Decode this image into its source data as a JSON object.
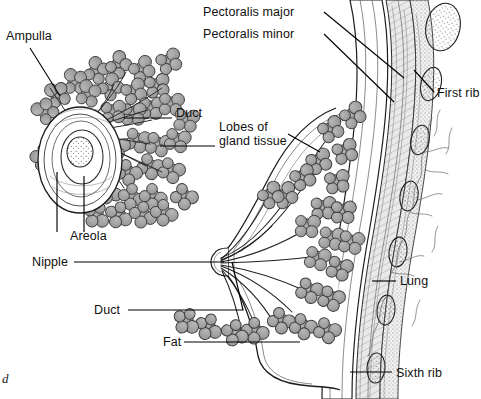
{
  "figure": {
    "part_marker": "d",
    "canvas": {
      "width": 481,
      "height": 399
    },
    "colors": {
      "background": "#ffffff",
      "ink": "#101010",
      "lobule_fill": "#9e9e9e",
      "lobule_stroke": "#3a3a3a",
      "duct_stroke": "#1a1a1a",
      "leader_line": "#000000",
      "muscle_fill": "#d6d6d6",
      "rib_fill": "#f2f2f2",
      "lung_stroke": "#555555"
    }
  },
  "labels": [
    {
      "id": "ampulla",
      "text": "Ampulla",
      "x": 6,
      "y": 36,
      "lines": [
        "Ampulla"
      ]
    },
    {
      "id": "duct-inset",
      "text": "Duct",
      "x": 176,
      "y": 113,
      "lines": [
        "Duct"
      ]
    },
    {
      "id": "lobes-of-gland",
      "text": "Lobes of gland tissue",
      "x": 219,
      "y": 127,
      "lines": [
        "Lobes of",
        "gland tissue"
      ]
    },
    {
      "id": "areola",
      "text": "Areola",
      "x": 70,
      "y": 236,
      "lines": [
        "Areola"
      ]
    },
    {
      "id": "nipple",
      "text": "Nipple",
      "x": 32,
      "y": 256,
      "lines": [
        "Nipple"
      ]
    },
    {
      "id": "duct-main",
      "text": "Duct",
      "x": 94,
      "y": 306,
      "lines": [
        "Duct"
      ]
    },
    {
      "id": "fat",
      "text": "Fat",
      "x": 163,
      "y": 337,
      "lines": [
        "Fat"
      ]
    },
    {
      "id": "pectoralis-major",
      "text": "Pectoralis major",
      "x": 203,
      "y": 7,
      "lines": [
        "Pectoralis major"
      ]
    },
    {
      "id": "pectoralis-minor",
      "text": "Pectoralis minor",
      "x": 203,
      "y": 29,
      "lines": [
        "Pectoralis minor"
      ]
    },
    {
      "id": "first-rib",
      "text": "First rib",
      "x": 437,
      "y": 88,
      "lines": [
        "First rib"
      ]
    },
    {
      "id": "lung",
      "text": "Lung",
      "x": 400,
      "y": 276,
      "lines": [
        "Lung"
      ]
    },
    {
      "id": "sixth-rib",
      "text": "Sixth rib",
      "x": 396,
      "y": 368,
      "lines": [
        "Sixth rib"
      ]
    }
  ],
  "leaders": [
    {
      "id": "leader-ampulla",
      "points": "30,48 60,96"
    },
    {
      "id": "leader-duct-inset",
      "points": "172,118 124,118"
    },
    {
      "id": "leader-lobes-inset",
      "points": "215,146 160,146"
    },
    {
      "id": "leader-areola",
      "points": "84,232 84,176"
    },
    {
      "id": "leader-nipple",
      "points": "74,262 224,262"
    },
    {
      "id": "leader-nipple-inset",
      "points": "57,232 57,172"
    },
    {
      "id": "leader-duct-main",
      "points": "128,310 243,310 232,262"
    },
    {
      "id": "leader-fat",
      "points": "184,342 300,342"
    },
    {
      "id": "leader-pect-major",
      "points": "324,12 404,78"
    },
    {
      "id": "leader-pect-minor",
      "points": "324,34 394,102"
    },
    {
      "id": "leader-first-rib",
      "points": "434,92 414,70"
    },
    {
      "id": "leader-lung",
      "points": "396,281 372,281"
    },
    {
      "id": "leader-sixth-rib",
      "points": "392,372 350,372"
    },
    {
      "id": "leader-lobes-main",
      "points": "290,134 318,152"
    }
  ],
  "regions": [
    {
      "id": "inset-areola-nipple",
      "name": "Nipple and areola surface view (inset)"
    },
    {
      "id": "inset-lobules",
      "name": "Lobules radiating around areola (inset)"
    },
    {
      "id": "breast-profile",
      "name": "Sagittal section of breast"
    },
    {
      "id": "chest-wall",
      "name": "Pectoral muscles and ribs"
    },
    {
      "id": "lung-field",
      "name": "Lung tissue"
    }
  ]
}
